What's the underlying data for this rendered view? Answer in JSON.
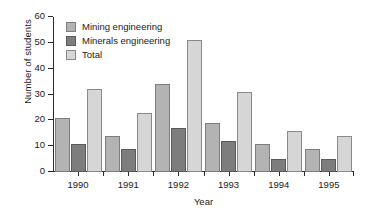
{
  "chart_data": {
    "type": "bar",
    "title": "",
    "xlabel": "Year",
    "ylabel": "Number of students",
    "categories": [
      "1990",
      "1991",
      "1992",
      "1993",
      "1994",
      "1995"
    ],
    "series": [
      {
        "name": "Mining engineering",
        "color": "#b3b3b3",
        "values": [
          21,
          14,
          34,
          19,
          11,
          9
        ]
      },
      {
        "name": "Minerals engineering",
        "color": "#7d7d7d",
        "values": [
          11,
          9,
          17,
          12,
          5,
          5
        ]
      },
      {
        "name": "Total",
        "color": "#d6d6d6",
        "values": [
          32,
          23,
          51,
          31,
          16,
          14
        ]
      }
    ],
    "ylim": [
      0,
      60
    ],
    "yticks": [
      0,
      10,
      20,
      30,
      40,
      50,
      60
    ],
    "ytick_labels": [
      "0",
      "10",
      "20",
      "30",
      "40",
      "50",
      "60"
    ],
    "grid": false,
    "legend_position": "top-left"
  }
}
